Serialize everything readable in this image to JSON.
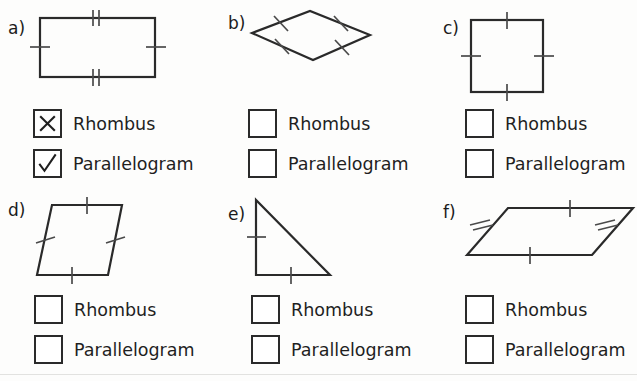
{
  "worksheet": {
    "option_labels": {
      "rhombus": "Rhombus",
      "parallelogram": "Parallelogram"
    },
    "colors": {
      "ink": "#1b1b1b",
      "shape_stroke": "#2a2a2a",
      "paper": "#fdfdfc",
      "rule": "#e2e2e0"
    },
    "problems": [
      {
        "id": "a",
        "label": "a)",
        "shape_name": "rectangle",
        "tick_marks": {
          "top": 2,
          "bottom": 2,
          "left": 1,
          "right": 1
        },
        "options": [
          {
            "label": "Rhombus",
            "mark": "x",
            "checked": true
          },
          {
            "label": "Parallelogram",
            "mark": "check",
            "checked": true
          }
        ]
      },
      {
        "id": "b",
        "label": "b)",
        "shape_name": "rhombus-diamond",
        "tick_marks": {
          "upper_left": 1,
          "upper_right": 1,
          "lower_left": 1,
          "lower_right": 1
        },
        "options": [
          {
            "label": "Rhombus",
            "mark": "none",
            "checked": false
          },
          {
            "label": "Parallelogram",
            "mark": "none",
            "checked": false
          }
        ]
      },
      {
        "id": "c",
        "label": "c)",
        "shape_name": "square",
        "tick_marks": {
          "top": 1,
          "bottom": 1,
          "left": 1,
          "right": 1
        },
        "options": [
          {
            "label": "Rhombus",
            "mark": "none",
            "checked": false
          },
          {
            "label": "Parallelogram",
            "mark": "none",
            "checked": false
          }
        ]
      },
      {
        "id": "d",
        "label": "d)",
        "shape_name": "slanted-rhombus",
        "tick_marks": {
          "top": 1,
          "bottom": 1,
          "left": 1,
          "right": 1
        },
        "options": [
          {
            "label": "Rhombus",
            "mark": "none",
            "checked": false
          },
          {
            "label": "Parallelogram",
            "mark": "none",
            "checked": false
          }
        ]
      },
      {
        "id": "e",
        "label": "e)",
        "shape_name": "right-triangle",
        "tick_marks": {
          "left": 1,
          "bottom": 1
        },
        "options": [
          {
            "label": "Rhombus",
            "mark": "none",
            "checked": false
          },
          {
            "label": "Parallelogram",
            "mark": "none",
            "checked": false
          }
        ]
      },
      {
        "id": "f",
        "label": "f)",
        "shape_name": "flat-parallelogram",
        "tick_marks": {
          "top": 1,
          "bottom": 1,
          "left": 2,
          "right": 2
        },
        "options": [
          {
            "label": "Rhombus",
            "mark": "none",
            "checked": false
          },
          {
            "label": "Parallelogram",
            "mark": "none",
            "checked": false
          }
        ]
      }
    ]
  }
}
